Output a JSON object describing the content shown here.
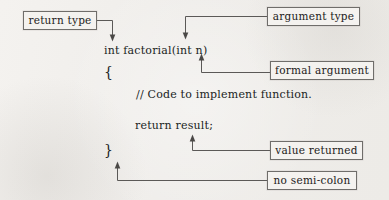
{
  "figure": {
    "kind": "annotated-code-diagram",
    "background_color": "#f1efec",
    "ink_color": "#232120",
    "box_border_color": "#6f6d6a",
    "connector_color": "#5b5957"
  },
  "code_lines": [
    {
      "id": "signature",
      "text": "int factorial(int n)"
    },
    {
      "id": "open_brace",
      "text": "{"
    },
    {
      "id": "comment",
      "text": "// Code to implement function."
    },
    {
      "id": "return_stmt",
      "text": "return result;"
    },
    {
      "id": "close_brace",
      "text": "}"
    }
  ],
  "callouts": [
    {
      "id": "return_type",
      "label": "return type",
      "points_to": "int"
    },
    {
      "id": "argument_type",
      "label": "argument type",
      "points_to": "int (parameter)"
    },
    {
      "id": "formal_argument",
      "label": "formal argument",
      "points_to": "n"
    },
    {
      "id": "value_returned",
      "label": "value returned",
      "points_to": "result"
    },
    {
      "id": "no_semicolon",
      "label": "no semi-colon",
      "points_to": "}"
    }
  ]
}
